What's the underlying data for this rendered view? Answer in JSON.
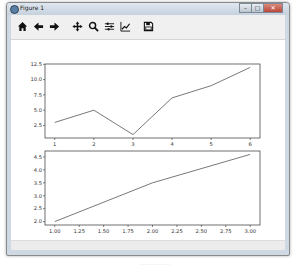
{
  "window": {
    "title": "Figure 1",
    "controls": [
      "minimize",
      "maximize",
      "close"
    ],
    "control_glyphs": {
      "minimize": "–",
      "maximize": "□",
      "close": "✕"
    }
  },
  "toolbar": {
    "buttons": [
      {
        "name": "home",
        "icon": "home-icon",
        "tooltip": "Reset original view"
      },
      {
        "name": "back",
        "icon": "arrow-left-icon",
        "tooltip": "Back to previous view"
      },
      {
        "name": "forward",
        "icon": "arrow-right-icon",
        "tooltip": "Forward to next view"
      },
      {
        "name": "pan",
        "icon": "move-icon",
        "tooltip": "Pan axes"
      },
      {
        "name": "zoom",
        "icon": "magnifier-icon",
        "tooltip": "Zoom to rectangle"
      },
      {
        "name": "subplots",
        "icon": "sliders-icon",
        "tooltip": "Configure subplots"
      },
      {
        "name": "edit",
        "icon": "line-chart-icon",
        "tooltip": "Edit axis"
      },
      {
        "name": "save",
        "icon": "floppy-disk-icon",
        "tooltip": "Save the figure"
      }
    ]
  },
  "colors": {
    "line": "#555555",
    "axes_frame": "#333333",
    "tick_label": "#333333"
  },
  "chart_data": [
    {
      "type": "line",
      "title": "",
      "xlabel": "",
      "ylabel": "",
      "x": [
        1,
        2,
        3,
        4,
        5,
        6
      ],
      "series": [
        {
          "name": "",
          "values": [
            3,
            5,
            1,
            7,
            9,
            12
          ]
        }
      ],
      "xlim": [
        0.75,
        6.25
      ],
      "ylim": [
        0.45,
        12.55
      ],
      "xticks": [
        1,
        2,
        3,
        4,
        5,
        6
      ],
      "xtick_labels": [
        "1",
        "2",
        "3",
        "4",
        "5",
        "6"
      ],
      "yticks": [
        2.5,
        5.0,
        7.5,
        10.0,
        12.5
      ],
      "ytick_labels": [
        "2.5",
        "5.0",
        "7.5",
        "10.0",
        "12.5"
      ],
      "grid": false,
      "legend": null
    },
    {
      "type": "line",
      "title": "",
      "xlabel": "",
      "ylabel": "",
      "x": [
        1,
        2,
        3
      ],
      "series": [
        {
          "name": "",
          "values": [
            2.0,
            3.5,
            4.6
          ]
        }
      ],
      "xlim": [
        0.9,
        3.1
      ],
      "ylim": [
        1.87,
        4.73
      ],
      "xticks": [
        1.0,
        1.25,
        1.5,
        1.75,
        2.0,
        2.25,
        2.5,
        2.75,
        3.0
      ],
      "xtick_labels": [
        "1.00",
        "1.25",
        "1.50",
        "1.75",
        "2.00",
        "2.25",
        "2.50",
        "2.75",
        "3.00"
      ],
      "yticks": [
        2.0,
        2.5,
        3.0,
        3.5,
        4.0,
        4.5
      ],
      "ytick_labels": [
        "2.0",
        "2.5",
        "3.0",
        "3.5",
        "4.0",
        "4.5"
      ],
      "grid": false,
      "legend": null
    }
  ],
  "caption": "………………"
}
